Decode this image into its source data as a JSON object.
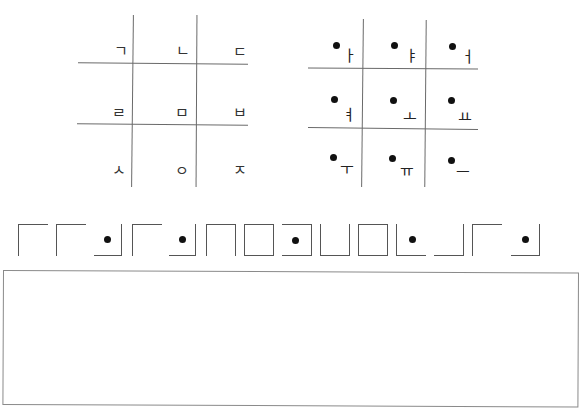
{
  "consonant_grid": {
    "cells": [
      {
        "row": 0,
        "col": 0,
        "char": "ㄱ"
      },
      {
        "row": 0,
        "col": 1,
        "char": "ㄴ"
      },
      {
        "row": 0,
        "col": 2,
        "char": "ㄷ"
      },
      {
        "row": 1,
        "col": 0,
        "char": "ㄹ"
      },
      {
        "row": 1,
        "col": 1,
        "char": "ㅁ"
      },
      {
        "row": 1,
        "col": 2,
        "char": "ㅂ"
      },
      {
        "row": 2,
        "col": 0,
        "char": "ㅅ"
      },
      {
        "row": 2,
        "col": 1,
        "char": "ㅇ"
      },
      {
        "row": 2,
        "col": 2,
        "char": "ㅈ"
      }
    ]
  },
  "vowel_grid": {
    "marker": "dot",
    "cells": [
      {
        "row": 0,
        "col": 0,
        "char": "ㅏ"
      },
      {
        "row": 0,
        "col": 1,
        "char": "ㅑ"
      },
      {
        "row": 0,
        "col": 2,
        "char": "ㅓ"
      },
      {
        "row": 1,
        "col": 0,
        "char": "ㅕ"
      },
      {
        "row": 1,
        "col": 1,
        "char": "ㅗ"
      },
      {
        "row": 1,
        "col": 2,
        "char": "ㅛ"
      },
      {
        "row": 2,
        "col": 0,
        "char": "ㅜ"
      },
      {
        "row": 2,
        "col": 1,
        "char": "ㅠ"
      },
      {
        "row": 2,
        "col": 2,
        "char": "ㅡ"
      }
    ]
  },
  "cipher_message": {
    "symbols": [
      {
        "shape": "top-left",
        "dot": false
      },
      {
        "shape": "top-left",
        "dot": false
      },
      {
        "shape": "bottom-right",
        "dot": true
      },
      {
        "shape": "top-left",
        "dot": false
      },
      {
        "shape": "bottom-right",
        "dot": true
      },
      {
        "shape": "top-left-right",
        "dot": false
      },
      {
        "shape": "box",
        "dot": false
      },
      {
        "shape": "top-right-bottom",
        "dot": true
      },
      {
        "shape": "left-bottom-right",
        "dot": false
      },
      {
        "shape": "box",
        "dot": false
      },
      {
        "shape": "left-bottom",
        "dot": true
      },
      {
        "shape": "bottom-right",
        "dot": false
      },
      {
        "shape": "top-left",
        "dot": false
      },
      {
        "shape": "bottom-right",
        "dot": true
      }
    ]
  },
  "answer_box": {
    "value": ""
  }
}
